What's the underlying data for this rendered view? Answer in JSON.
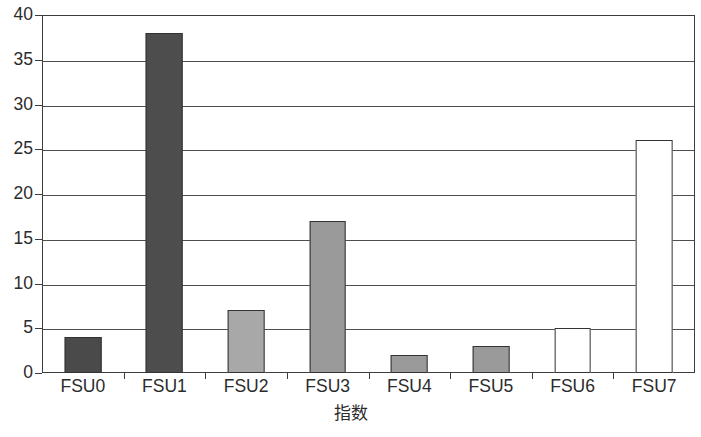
{
  "chart_data": {
    "type": "bar",
    "title": "",
    "subtitle": "",
    "xlabel": "指数",
    "ylabel": "",
    "categories": [
      "FSU0",
      "FSU1",
      "FSU2",
      "FSU3",
      "FSU4",
      "FSU5",
      "FSU6",
      "FSU7"
    ],
    "values": [
      4,
      38,
      7,
      17,
      2,
      3,
      5,
      26
    ],
    "bar_colors": [
      "#4a4a4a",
      "#4d4d4d",
      "#a8a8a8",
      "#9a9a9a",
      "#9a9a9a",
      "#9a9a9a",
      "#ffffff",
      "#ffffff"
    ],
    "bar_edge_color": "#333333",
    "ylim": [
      0,
      40
    ],
    "y_ticks": [
      0,
      5,
      10,
      15,
      20,
      25,
      30,
      35,
      40
    ],
    "y_tick_labels": [
      "0",
      "5",
      "10",
      "15",
      "20",
      "25",
      "30",
      "35",
      "40"
    ],
    "grid": true,
    "grid_axis": "y",
    "grid_color": "#4f4f4f",
    "legend": null,
    "legend_position": "none",
    "frame_color": "#3d3d3d",
    "background_color": "#ffffff"
  },
  "axes": {
    "x_axis_title": "指数",
    "y_axis_title": ""
  }
}
